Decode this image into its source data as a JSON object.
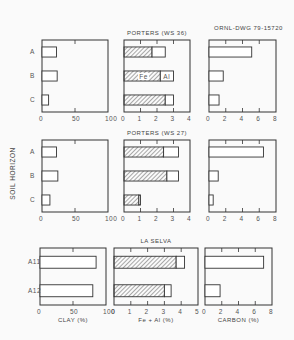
{
  "drawing_id": "ORNL-DWG 79-15720",
  "y_axis_label": "SOIL HORIZON",
  "x_axis_labels": {
    "clay": "CLAY (%)",
    "feal": "Fe + Al (%)",
    "carbon": "CARBON (%)"
  },
  "legend": {
    "fe": "Fe",
    "al": "Al"
  },
  "colors": {
    "ink": "#333333",
    "background": "#fafafa",
    "hatch": "#555555"
  },
  "chart_data": [
    {
      "type": "bar",
      "title": "PORTERS (WS 36)",
      "orientation": "horizontal",
      "categories": [
        "A",
        "B",
        "C"
      ],
      "panels": [
        {
          "xlabel": "CLAY (%)",
          "xlim": [
            0,
            100
          ],
          "ticks": [
            0,
            50,
            100
          ],
          "series": [
            {
              "name": "Clay",
              "values": [
                22,
                23,
                10
              ]
            }
          ]
        },
        {
          "xlabel": "Fe + Al (%)",
          "xlim": [
            0,
            4
          ],
          "ticks": [
            0,
            1,
            2,
            3,
            4
          ],
          "stacked": true,
          "series": [
            {
              "name": "Fe",
              "values": [
                1.7,
                2.2,
                2.5
              ]
            },
            {
              "name": "Al",
              "values": [
                0.8,
                0.8,
                0.5
              ]
            }
          ]
        },
        {
          "xlabel": "CARBON (%)",
          "xlim": [
            0,
            8
          ],
          "ticks": [
            0,
            2,
            4,
            6,
            8
          ],
          "series": [
            {
              "name": "Carbon",
              "values": [
                5.1,
                1.7,
                1.2
              ]
            }
          ]
        }
      ]
    },
    {
      "type": "bar",
      "title": "PORTERS (WS 27)",
      "orientation": "horizontal",
      "categories": [
        "A",
        "B",
        "C"
      ],
      "panels": [
        {
          "xlabel": "CLAY (%)",
          "xlim": [
            0,
            100
          ],
          "ticks": [
            0,
            50,
            100
          ],
          "series": [
            {
              "name": "Clay",
              "values": [
                22,
                24,
                12
              ]
            }
          ]
        },
        {
          "xlabel": "Fe + Al (%)",
          "xlim": [
            0,
            4
          ],
          "ticks": [
            0,
            1,
            2,
            3,
            4
          ],
          "stacked": true,
          "series": [
            {
              "name": "Fe",
              "values": [
                2.4,
                2.6,
                0.9
              ]
            },
            {
              "name": "Al",
              "values": [
                0.9,
                0.7,
                0.1
              ]
            }
          ]
        },
        {
          "xlabel": "CARBON (%)",
          "xlim": [
            0,
            8
          ],
          "ticks": [
            0,
            2,
            4,
            6,
            8
          ],
          "series": [
            {
              "name": "Carbon",
              "values": [
                6.5,
                1.1,
                0.5
              ]
            }
          ]
        }
      ]
    },
    {
      "type": "bar",
      "title": "LA SELVA",
      "orientation": "horizontal",
      "categories": [
        "A11",
        "A12"
      ],
      "panels": [
        {
          "xlabel": "CLAY (%)",
          "xlim": [
            0,
            100
          ],
          "ticks": [
            0,
            50,
            100
          ],
          "series": [
            {
              "name": "Clay",
              "values": [
                85,
                80
              ]
            }
          ]
        },
        {
          "xlabel": "Fe + Al (%)",
          "xlim": [
            0,
            5
          ],
          "ticks": [
            0,
            1,
            2,
            3,
            4,
            5
          ],
          "stacked": true,
          "series": [
            {
              "name": "Fe",
              "values": [
                3.7,
                3.0
              ]
            },
            {
              "name": "Al",
              "values": [
                0.5,
                0.4
              ]
            }
          ]
        },
        {
          "xlabel": "CARBON (%)",
          "xlim": [
            0,
            8
          ],
          "ticks": [
            0,
            2,
            4,
            6,
            8
          ],
          "series": [
            {
              "name": "Carbon",
              "values": [
                7.0,
                1.8
              ]
            }
          ]
        }
      ]
    }
  ]
}
